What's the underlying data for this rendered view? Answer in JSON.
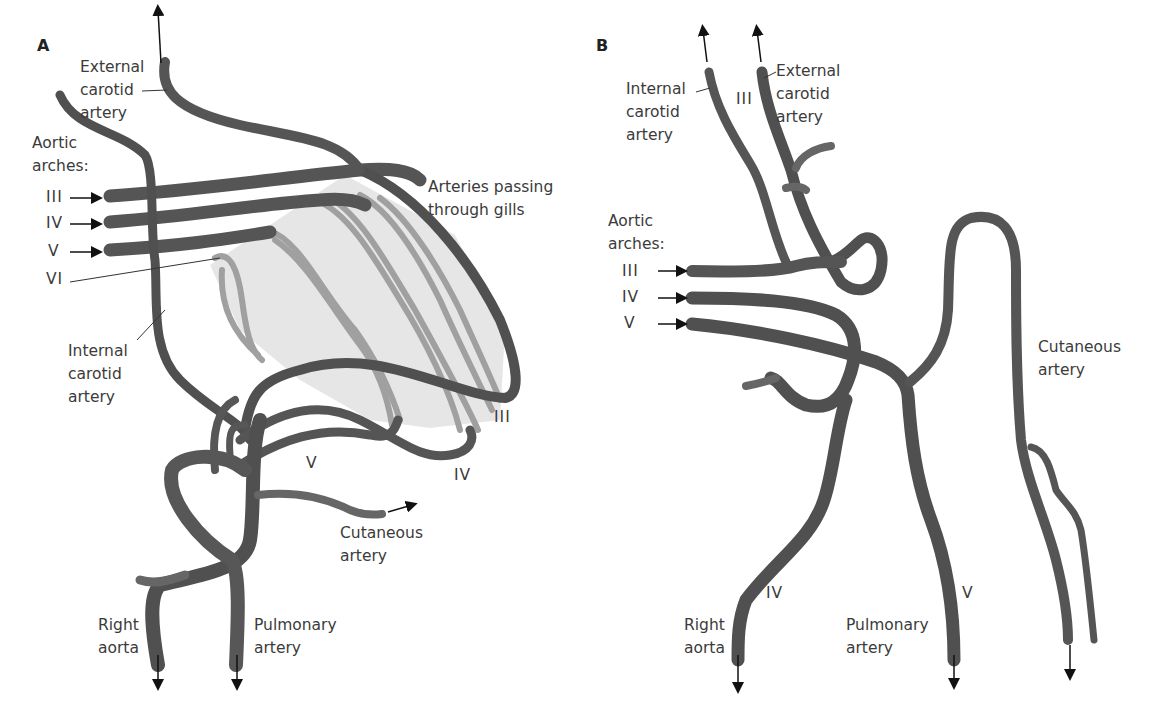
{
  "panels": [
    {
      "id": "A",
      "letter": "A",
      "labels": {
        "external_carotid": "External\ncarotid\nartery",
        "aortic_arches": "Aortic\narches:",
        "arch_III": "III",
        "arch_IV": "IV",
        "arch_V": "V",
        "arch_VI": "VI",
        "gills": "Arteries passing\nthrough gills",
        "internal_carotid": "Internal\ncarotid\nartery",
        "loop_III": "III",
        "loop_IV": "IV",
        "loop_V": "V",
        "cutaneous": "Cutaneous\nartery",
        "right_aorta": "Right\naorta",
        "pulmonary": "Pulmonary\nartery"
      }
    },
    {
      "id": "B",
      "letter": "B",
      "labels": {
        "internal_carotid": "Internal\ncarotid\nartery",
        "arch_III_top": "III",
        "external_carotid": "External\ncarotid\nartery",
        "aortic_arches": "Aortic\narches:",
        "arch_III": "III",
        "arch_IV": "IV",
        "arch_V": "V",
        "cutaneous": "Cutaneous\nartery",
        "right_aorta": "Right\naorta",
        "vessel_IV": "IV",
        "pulmonary": "Pulmonary\nartery",
        "vessel_V": "V"
      }
    }
  ],
  "colors": {
    "vessel_dark": "#4a4a4a",
    "vessel_mid": "#6b6b6b",
    "vessel_highlight": "#8f8f8f",
    "gill_vessel": "#9a9a9a",
    "gill_region": "#e4e4e4",
    "text": "#3b3b3b",
    "arrow": "#111111"
  }
}
